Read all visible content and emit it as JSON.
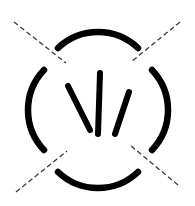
{
  "figure": {
    "canvas": {
      "width": 195,
      "height": 206,
      "background_color": "#ffffff"
    },
    "ink_color": "#000000",
    "dash_color": "#3a3a3a",
    "center": {
      "x": 98,
      "y": 110
    },
    "circle_radius": 58,
    "arc_stroke_width": 6.5,
    "ray_stroke_width": 6.0,
    "dash_stroke_width": 1.3,
    "dash_pattern": "5 3"
  },
  "elements": {
    "arcs": [
      {
        "name": "top-arc",
        "label": "Top arc segment",
        "path": "M 58 48 A 58 58 0 0 1 138 48",
        "start_angle_deg": 223,
        "end_angle_deg": 317
      },
      {
        "name": "right-arc",
        "label": "Right arc segment",
        "path": "M 152 70 A 58 58 0 0 1 152 150",
        "start_angle_deg": 313,
        "end_angle_deg": 43
      },
      {
        "name": "bottom-arc",
        "label": "Bottom arc segment",
        "path": "M 58 172 A 58 58 0 0 0 138 172",
        "start_angle_deg": 137,
        "end_angle_deg": 43
      },
      {
        "name": "left-arc",
        "label": "Left arc segment",
        "path": "M 44 70 A 58 58 0 0 0 44 150",
        "start_angle_deg": 227,
        "end_angle_deg": 137
      }
    ],
    "rays": [
      {
        "name": "left-ray",
        "label": "Left inner ray",
        "x1": 68,
        "y1": 86,
        "x2": 90,
        "y2": 130,
        "angle_deg": 63
      },
      {
        "name": "center-ray",
        "label": "Centre inner ray",
        "x1": 100,
        "y1": 73,
        "x2": 98,
        "y2": 134,
        "angle_deg": 92
      },
      {
        "name": "right-ray",
        "label": "Right inner ray",
        "x1": 129,
        "y1": 92,
        "x2": 115,
        "y2": 134,
        "angle_deg": 108
      }
    ],
    "dashes": [
      {
        "name": "dash-top-left",
        "label": "Upper-left dashed radial",
        "x1": 14,
        "y1": 22,
        "x2": 66,
        "y2": 63
      },
      {
        "name": "dash-top-right",
        "label": "Upper-right dashed radial",
        "x1": 180,
        "y1": 22,
        "x2": 131,
        "y2": 62
      },
      {
        "name": "dash-bottom-right",
        "label": "Lower-right dashed radial",
        "x1": 178,
        "y1": 185,
        "x2": 130,
        "y2": 145
      },
      {
        "name": "dash-bottom-left",
        "label": "Lower-left dashed radial",
        "x1": 16,
        "y1": 192,
        "x2": 67,
        "y2": 151
      }
    ]
  }
}
